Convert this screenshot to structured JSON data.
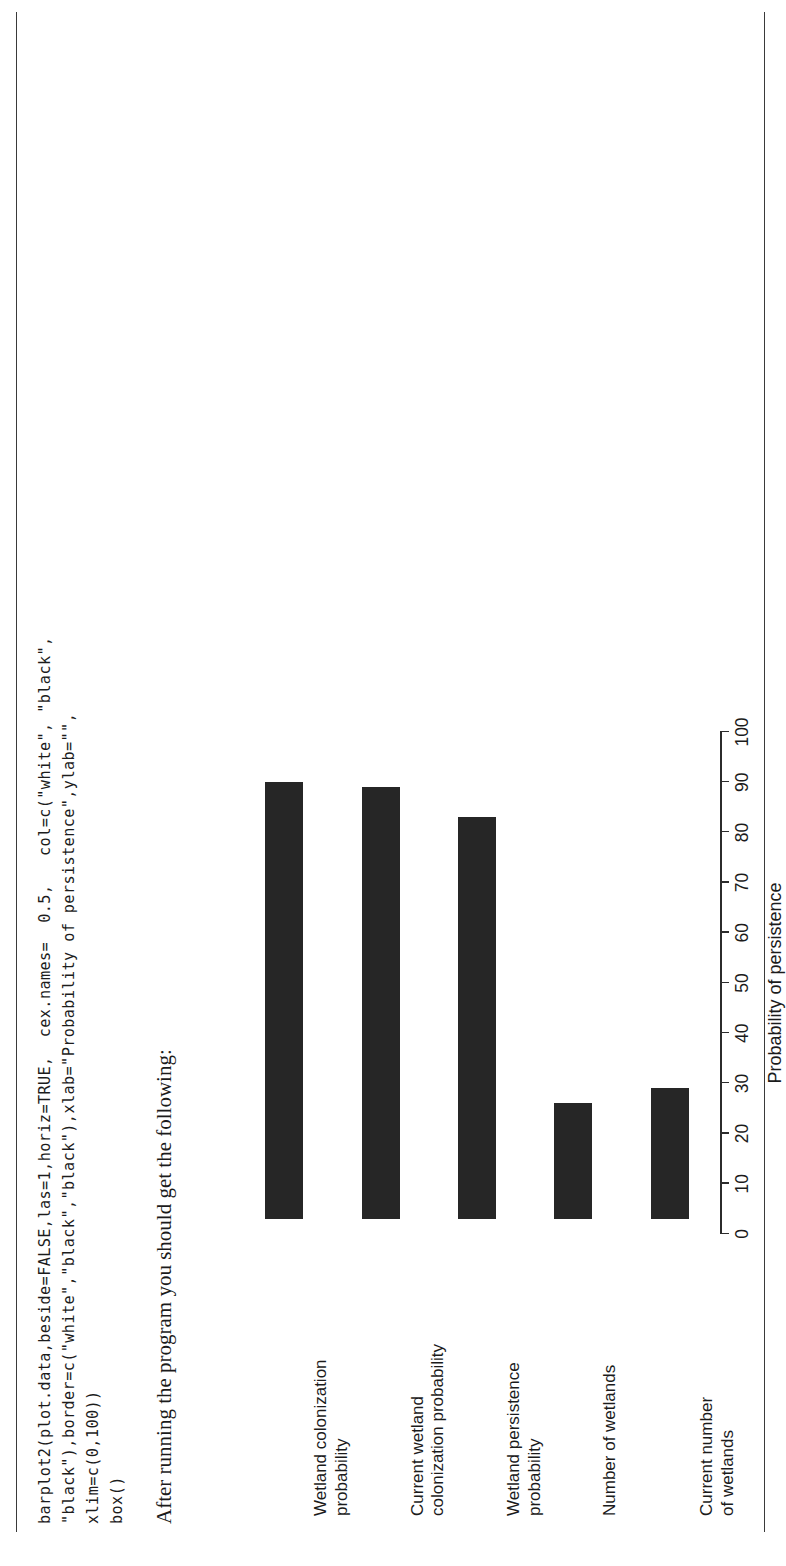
{
  "document": {
    "code_lines": [
      "barplot2(plot.data,beside=FALSE,las=1,horiz=TRUE,  cex.names=  0.5,   col=c(\"white\", \"black\",",
      "\"black\"),border=c(\"white\",\"black\",\"black\"),xlab=\"Probability of persistence\",ylab=\"\",",
      "xlim=c(0,100))",
      "box()"
    ],
    "prose": "After running the program you should get the following:"
  },
  "chart_data": {
    "type": "bar",
    "orientation": "horizontal",
    "title": "",
    "xlabel": "Probability of persistence",
    "ylabel": "",
    "xlim": [
      0,
      100
    ],
    "xticks": [
      0,
      10,
      20,
      30,
      40,
      50,
      60,
      70,
      80,
      90,
      100
    ],
    "grid": false,
    "legend": "none",
    "bar_color": "#262626",
    "bar_border_color": "#262626",
    "categories": [
      "Wetland colonization\nprobability",
      "Current wetland\ncolonization probability",
      "Wetland persistence\nprobability",
      "Number of wetlands",
      "Current number\nof wetlands"
    ],
    "category_lines": [
      [
        "Wetland colonization",
        "probability"
      ],
      [
        "Current wetland",
        "colonization probability"
      ],
      [
        "Wetland persistence",
        "probability"
      ],
      [
        "Number of wetlands",
        ""
      ],
      [
        "Current number",
        "of wetlands"
      ]
    ],
    "values": [
      90,
      89,
      83,
      26,
      29
    ],
    "bar_start": 3
  }
}
